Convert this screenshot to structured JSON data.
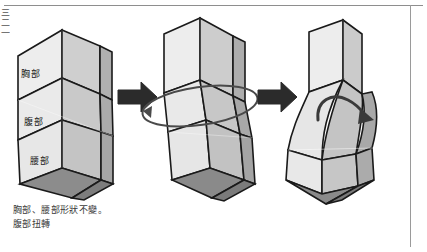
{
  "page": {
    "background": "#ffffff",
    "edge_margin_text": "三二一",
    "frame_color": "#8e8e8e"
  },
  "figure": {
    "segment_labels": [
      {
        "id": "chest",
        "text": "胸部"
      },
      {
        "id": "abdomen",
        "text": "腹部"
      },
      {
        "id": "waist",
        "text": "腰部"
      }
    ],
    "steps": [
      {
        "id": "step-1",
        "name": "neutral-solid"
      },
      {
        "id": "step-2",
        "name": "rotation-solid"
      },
      {
        "id": "step-3",
        "name": "twisted-solid"
      }
    ],
    "arrows": [
      {
        "id": "arrow-1",
        "name": "step-arrow"
      },
      {
        "id": "arrow-2",
        "name": "step-arrow"
      }
    ],
    "annotations": [
      {
        "id": "rotation-ellipse",
        "name": "rotation-ellipse"
      },
      {
        "id": "twist-arrow",
        "name": "curved-twist-arrow"
      }
    ],
    "colors": {
      "face_light": "#ededed",
      "face_mid": "#d2d2d2",
      "face_dark": "#b4b4b4",
      "face_darkest": "#8f8f8f",
      "outline": "#1a1a1a",
      "arrow": "#2b2b2b"
    }
  },
  "caption": {
    "line1": "胸部、腰部形狀不變。",
    "line2": "腹部扭轉"
  }
}
